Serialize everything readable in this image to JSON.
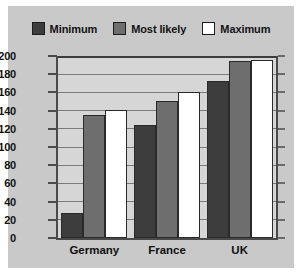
{
  "chart_data": {
    "type": "bar",
    "title": "",
    "subtitle": "",
    "xlabel": "",
    "ylabel": "",
    "categories": [
      "Germany",
      "France",
      "UK"
    ],
    "series": [
      {
        "name": "Minimum",
        "color": "#3d3d3d",
        "values": [
          28,
          124,
          172
        ]
      },
      {
        "name": "Most likely",
        "color": "#6e6e6e",
        "values": [
          135,
          151,
          195
        ]
      },
      {
        "name": "Maximum",
        "color": "#ffffff",
        "values": [
          141,
          161,
          196
        ]
      }
    ],
    "ylim": [
      0,
      200
    ],
    "ytick_step": 20,
    "yticks": [
      0,
      20,
      40,
      60,
      80,
      100,
      120,
      140,
      160,
      180,
      200
    ],
    "ytick_labels": [
      "0",
      "20",
      "40",
      "60",
      "80",
      "100",
      "120",
      "140",
      "160",
      "180",
      "200"
    ],
    "grid": true,
    "grid_axis": "y",
    "legend_position": "top-center",
    "plot_background": "#d6d6d6",
    "figure_background": "#c9c9c9",
    "axis_color": "#4a4a4a",
    "gridline_color": "#7b7b7b",
    "bar_edge_color": "#2a2a2a",
    "text_color": "#131313"
  }
}
